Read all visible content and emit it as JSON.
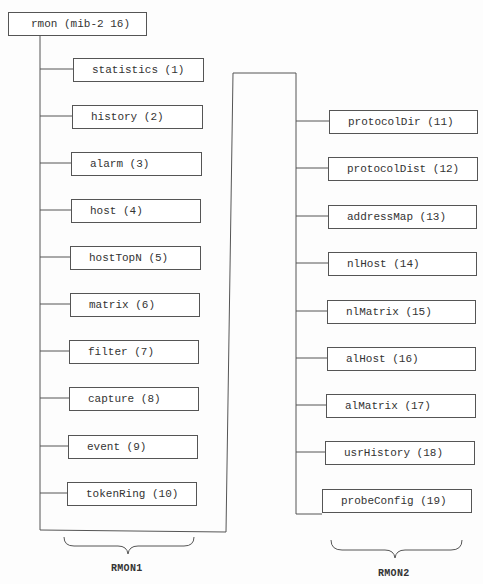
{
  "diagram": {
    "root": {
      "label": "rmon (mib-2 16)"
    },
    "rmon1": {
      "label": "RMON1",
      "groups": [
        {
          "label": "statistics (1)"
        },
        {
          "label": "history (2)"
        },
        {
          "label": "alarm (3)"
        },
        {
          "label": "host (4)"
        },
        {
          "label": "hostTopN (5)"
        },
        {
          "label": "matrix (6)"
        },
        {
          "label": "filter (7)"
        },
        {
          "label": "capture (8)"
        },
        {
          "label": "event (9)"
        },
        {
          "label": "tokenRing (10)"
        }
      ]
    },
    "rmon2": {
      "label": "RMON2",
      "groups": [
        {
          "label": "protocolDir (11)"
        },
        {
          "label": "protocolDist (12)"
        },
        {
          "label": "addressMap (13)"
        },
        {
          "label": "nlHost (14)"
        },
        {
          "label": "nlMatrix (15)"
        },
        {
          "label": "alHost (16)"
        },
        {
          "label": "alMatrix (17)"
        },
        {
          "label": "usrHistory (18)"
        },
        {
          "label": "probeConfig (19)"
        }
      ]
    },
    "colors": {
      "line": "#555555",
      "text": "#333333",
      "background": "#ffffff"
    }
  }
}
